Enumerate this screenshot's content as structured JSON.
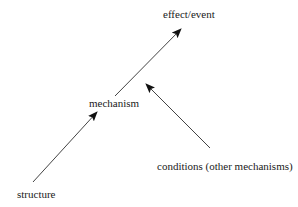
{
  "diagram": {
    "nodes": [
      {
        "id": "effect",
        "label": "effect/event"
      },
      {
        "id": "mechanism",
        "label": "mechanism"
      },
      {
        "id": "structure",
        "label": "structure"
      },
      {
        "id": "conditions",
        "label": "conditions (other mechanisms)"
      }
    ],
    "edges": [
      {
        "from": "structure",
        "to": "mechanism"
      },
      {
        "from": "mechanism",
        "to": "effect"
      },
      {
        "from": "conditions",
        "to": "mechanism-effect-link"
      }
    ],
    "colors": {
      "line": "#333333",
      "text": "#1a1a1a",
      "background": "#ffffff"
    }
  }
}
